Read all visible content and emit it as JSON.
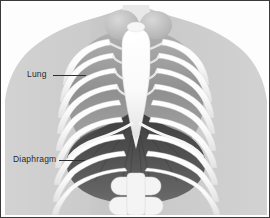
{
  "figure": {
    "style": "grayscale medical illustration",
    "border_color": "#3a3a3a",
    "background_color": "#fdfdfd"
  },
  "labels": [
    {
      "id": "lung",
      "text": "Lung",
      "leader_line": true,
      "points_to": "lung-tissue-left"
    },
    {
      "id": "diaphragm",
      "text": "Diaphragm",
      "leader_line": true,
      "points_to": "diaphragm-muscle"
    }
  ],
  "anatomy": {
    "body_silhouette": {
      "name": "torso-silhouette",
      "color": "#c9c9c9"
    },
    "ribcage": {
      "name": "ribcage",
      "bone_color": "#fbfbfb",
      "shadow_color": "#bdbdbd",
      "rib_pairs": 10
    },
    "sternum": {
      "name": "sternum",
      "color": "#fbfbfb"
    },
    "clavicles": {
      "name": "clavicle-heads",
      "count": 2,
      "color": "#c2c2c2"
    },
    "lungs": {
      "name": "lung-tissue",
      "color": "#9a9a9a"
    },
    "diaphragm": {
      "name": "diaphragm-muscle",
      "color": "#4a4a4a"
    },
    "vertebrae": {
      "name": "lumbar-vertebrae",
      "color": "#f2f2f2"
    }
  }
}
